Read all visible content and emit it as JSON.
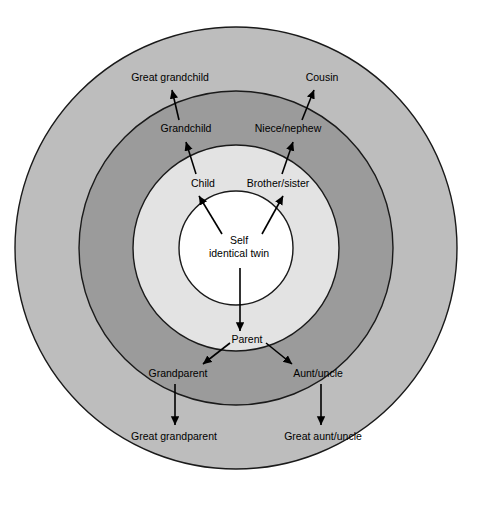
{
  "figure": {
    "type": "concentric-ring-kinship-diagram",
    "background_color": "#ffffff",
    "width": 485,
    "height": 506
  },
  "rings": [
    {
      "index": 0,
      "name": "self-core",
      "color": "#ffffff",
      "radius": 57,
      "stroke": "#1a1a1a"
    },
    {
      "index": 1,
      "name": "first-degree-ring",
      "color": "#e3e3e3",
      "radius": 103,
      "stroke": "#1a1a1a"
    },
    {
      "index": 2,
      "name": "second-degree-ring",
      "color": "#9b9b9b",
      "radius": 157,
      "stroke": "#1a1a1a"
    },
    {
      "index": 3,
      "name": "third-degree-ring",
      "color": "#bdbdbd",
      "radius": 221,
      "stroke": "#1a1a1a"
    }
  ],
  "center": {
    "x": 236,
    "y": 248,
    "label_line1": "Self",
    "label_line2": "identical twin"
  },
  "labels": [
    {
      "id": "child",
      "text": "Child",
      "x": 203,
      "y": 184
    },
    {
      "id": "brother-sister",
      "text": "Brother/sister",
      "x": 278,
      "y": 184
    },
    {
      "id": "grandchild",
      "text": "Grandchild",
      "x": 186,
      "y": 129
    },
    {
      "id": "niece-nephew",
      "text": "Niece/nephew",
      "x": 288,
      "y": 129
    },
    {
      "id": "great-grandchild",
      "text": "Great grandchild",
      "x": 170,
      "y": 78
    },
    {
      "id": "cousin",
      "text": "Cousin",
      "x": 322,
      "y": 78
    },
    {
      "id": "parent",
      "text": "Parent",
      "x": 247,
      "y": 340
    },
    {
      "id": "grandparent",
      "text": "Grandparent",
      "x": 178,
      "y": 374
    },
    {
      "id": "aunt-uncle",
      "text": "Aunt/uncle",
      "x": 318,
      "y": 374
    },
    {
      "id": "great-grandparent",
      "text": "Great grandparent",
      "x": 174,
      "y": 437
    },
    {
      "id": "great-aunt-uncle",
      "text": "Great aunt/uncle",
      "x": 323,
      "y": 437
    }
  ],
  "arrows": [
    {
      "id": "self-to-child",
      "from_label": "Self",
      "to_label": "Child",
      "x1": 222,
      "y1": 234,
      "x2": 199,
      "y2": 196
    },
    {
      "id": "self-to-brother-sister",
      "from_label": "Self",
      "to_label": "Brother/sister",
      "x1": 262,
      "y1": 234,
      "x2": 283,
      "y2": 196
    },
    {
      "id": "child-to-grandchild",
      "from_label": "Child",
      "to_label": "Grandchild",
      "x1": 196,
      "y1": 174,
      "x2": 186,
      "y2": 142
    },
    {
      "id": "brother-sister-to-niece-nephew",
      "from_label": "Brother/sister",
      "to_label": "Niece/nephew",
      "x1": 282,
      "y1": 174,
      "x2": 293,
      "y2": 142
    },
    {
      "id": "grandchild-to-great-grandchild",
      "from_label": "Grandchild",
      "to_label": "Great grandchild",
      "x1": 179,
      "y1": 120,
      "x2": 172,
      "y2": 90
    },
    {
      "id": "niece-nephew-to-cousin",
      "from_label": "Niece/nephew",
      "to_label": "Cousin",
      "x1": 302,
      "y1": 120,
      "x2": 314,
      "y2": 90
    },
    {
      "id": "self-to-parent",
      "from_label": "Self",
      "to_label": "Parent",
      "x1": 240,
      "y1": 268,
      "x2": 240,
      "y2": 331
    },
    {
      "id": "parent-to-grandparent",
      "from_label": "Parent",
      "to_label": "Grandparent",
      "x1": 230,
      "y1": 343,
      "x2": 203,
      "y2": 364
    },
    {
      "id": "parent-to-aunt-uncle",
      "from_label": "Parent",
      "to_label": "Aunt/uncle",
      "x1": 266,
      "y1": 343,
      "x2": 292,
      "y2": 364
    },
    {
      "id": "grandparent-to-great-grandparent",
      "from_label": "Grandparent",
      "to_label": "Great grandparent",
      "x1": 175,
      "y1": 384,
      "x2": 175,
      "y2": 425
    },
    {
      "id": "aunt-uncle-to-great-aunt-uncle",
      "from_label": "Aunt/uncle",
      "to_label": "Great aunt/uncle",
      "x1": 321,
      "y1": 384,
      "x2": 321,
      "y2": 425
    }
  ]
}
